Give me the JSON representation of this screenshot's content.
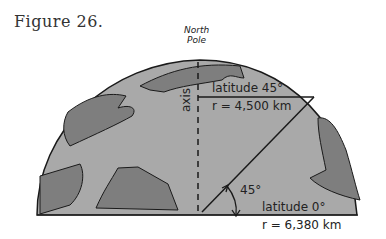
{
  "figure": {
    "title": "Figure 26.",
    "pole_label_line1": "North",
    "pole_label_line2": "Pole",
    "axis_label": "axis",
    "lat45_label": "latitude 45°",
    "lat45_radius": "r = 4,500 km",
    "angle_label": "45°",
    "lat0_label": "latitude 0°",
    "lat0_radius": "r = 6,380 km",
    "colors": {
      "ocean": "#a9a9a9",
      "land": "#7e7e7e",
      "outline": "#1a1a1a"
    }
  }
}
